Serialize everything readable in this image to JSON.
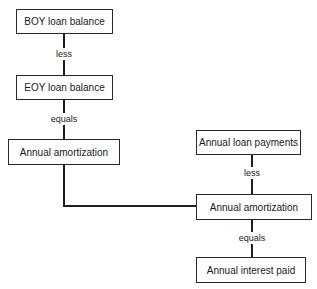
{
  "diagram": {
    "left_column": {
      "box1": "BOY loan balance",
      "op1": "less",
      "box2": "EOY loan balance",
      "op2": "equals",
      "box3": "Annual amortization"
    },
    "right_column": {
      "box1": "Annual loan payments",
      "op1": "less",
      "box2": "Annual amortization",
      "op2": "equals",
      "box3": "Annual interest paid"
    }
  }
}
